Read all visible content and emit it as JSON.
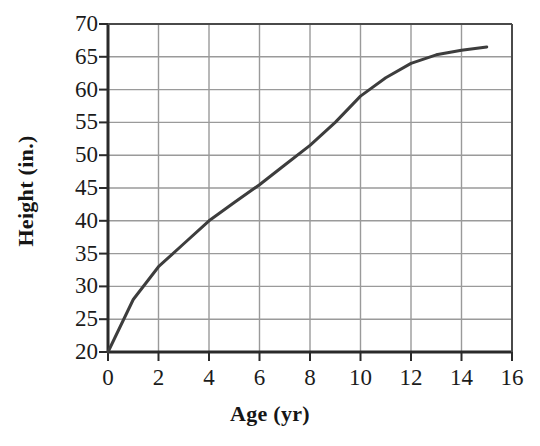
{
  "chart_data": {
    "type": "line",
    "title": "",
    "subtitle": "",
    "xlabel": "Age (yr)",
    "ylabel": "Height (in.)",
    "xlim": [
      0,
      16
    ],
    "ylim": [
      20,
      70
    ],
    "xticks": [
      0,
      2,
      4,
      6,
      8,
      10,
      12,
      14,
      16
    ],
    "yticks": [
      20,
      25,
      30,
      35,
      40,
      45,
      50,
      55,
      60,
      65,
      70
    ],
    "xtick_labels": [
      "0",
      "2",
      "4",
      "6",
      "8",
      "10",
      "12",
      "14",
      "16"
    ],
    "ytick_labels": [
      "20",
      "25",
      "30",
      "35",
      "40",
      "45",
      "50",
      "55",
      "60",
      "65",
      "70"
    ],
    "grid": true,
    "grid_color": "#9a9a9a",
    "axis_color": "#2a2a2a",
    "legend": false,
    "legend_position": "none",
    "series": [
      {
        "name": "Height vs Age",
        "color": "#3d3d3d",
        "line_width": 3,
        "x": [
          0,
          1,
          2,
          3,
          4,
          5,
          6,
          7,
          8,
          9,
          10,
          11,
          12,
          13,
          14,
          15
        ],
        "y": [
          20,
          28,
          33,
          36.5,
          40,
          42.8,
          45.5,
          48.5,
          51.5,
          55,
          59,
          61.8,
          64,
          65.3,
          66,
          66.5
        ]
      }
    ]
  },
  "annotations": []
}
